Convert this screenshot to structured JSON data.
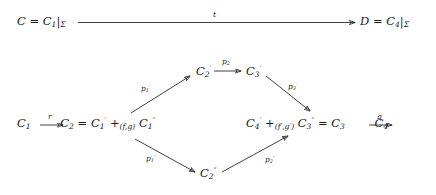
{
  "diagram": {
    "type": "commutative-diagram",
    "nodes": [
      {
        "id": "top-left",
        "text": "C = C₁|Σ",
        "x": 17,
        "y": 16
      },
      {
        "id": "top-right",
        "text": "D = C₄|Σ",
        "x": 360,
        "y": 16
      },
      {
        "id": "c2-prime",
        "text": "C₂′",
        "x": 196,
        "y": 66
      },
      {
        "id": "c3-prime",
        "text": "C₃′",
        "x": 246,
        "y": 66
      },
      {
        "id": "mid-left",
        "text": "C₁ → C₂ = C₁′ +(f,g) C₁″",
        "x": 17,
        "y": 118
      },
      {
        "id": "mid-right",
        "text": "C₄′ +(f′,g′) C₃″ = C₃ → C₄",
        "x": 246,
        "y": 118
      },
      {
        "id": "c2-dprime",
        "text": "C₂″",
        "x": 200,
        "y": 168
      }
    ],
    "node_parts": {
      "top_left": {
        "lhs": "C",
        "eq": "=",
        "base": "C",
        "sub": "1",
        "restrict": "|",
        "domain": "Σ"
      },
      "top_right": {
        "lhs": "D",
        "eq": "=",
        "base": "C",
        "sub": "4",
        "restrict": "|",
        "domain": "Σ"
      },
      "c2_prime": {
        "base": "C",
        "sub": "2",
        "prime": "′"
      },
      "c3_prime": {
        "base": "C",
        "sub": "3",
        "prime": "′"
      },
      "c2_dprime": {
        "base": "C",
        "sub": "2",
        "prime": "″"
      },
      "mid_left": {
        "first": "C",
        "first_sub": "1",
        "second": "C",
        "second_sub": "2",
        "eq": "=",
        "sum_left": "C",
        "sum_left_sub": "1",
        "sum_left_prime": "′",
        "plus": "+",
        "pushout_sub": "(f,g)",
        "sum_right": "C",
        "sum_right_sub": "1",
        "sum_right_prime": "″"
      },
      "mid_right": {
        "sum_left": "C",
        "sum_left_sub": "4",
        "sum_left_prime": "′",
        "plus": "+",
        "pushout_sub": "(f′,g′)",
        "sum_right": "C",
        "sum_right_sub": "3",
        "sum_right_prime": "″",
        "eq": "=",
        "third": "C",
        "third_sub": "3",
        "fourth": "C",
        "fourth_sub": "4"
      }
    },
    "arrow_labels": {
      "t": "t",
      "r": "r",
      "q": "q",
      "p1p": "p₁′",
      "p2p": "p₂′",
      "p3p": "p₃′",
      "p1pp": "p₁″",
      "p2pp": "p₂″"
    },
    "arrow_label_parts": {
      "p1p": {
        "base": "p",
        "sub": "1",
        "prime": "′"
      },
      "p2p": {
        "base": "p",
        "sub": "2",
        "prime": "′"
      },
      "p3p": {
        "base": "p",
        "sub": "3",
        "prime": "′"
      },
      "p1pp": {
        "base": "p",
        "sub": "1",
        "prime": "″"
      },
      "p2pp": {
        "base": "p",
        "sub": "2",
        "prime": "″"
      }
    },
    "colors": {
      "background": "#ffffff",
      "ink": "#1a1a1a",
      "stroke": "#2b2b2b"
    }
  }
}
